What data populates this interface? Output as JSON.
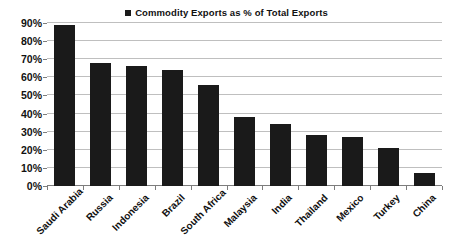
{
  "legend": {
    "swatch_color": "#1a1a1a",
    "label": "Commodity Exports as % of Total Exports"
  },
  "axis": {
    "y_ticks": [
      "0%",
      "10%",
      "20%",
      "30%",
      "40%",
      "50%",
      "60%",
      "70%",
      "80%",
      "90%"
    ]
  },
  "chart_data": {
    "type": "bar",
    "title": "",
    "subtitle": "",
    "legend_entries": [
      "Commodity Exports as % of Total Exports"
    ],
    "legend_position": "top-center",
    "categories": [
      "Saudi Arabia",
      "Russia",
      "Indonesia",
      "Brazil",
      "South Africa",
      "Malaysia",
      "India",
      "Thailand",
      "Mexico",
      "Turkey",
      "China"
    ],
    "values": [
      89,
      68,
      66,
      64,
      56,
      38,
      34,
      28,
      27,
      21,
      7
    ],
    "value_unit": "%",
    "xlabel": "",
    "ylabel": "",
    "ylim": [
      0,
      90
    ],
    "ytick_values": [
      0,
      10,
      20,
      30,
      40,
      50,
      60,
      70,
      80,
      90
    ],
    "ytick_labels": [
      "0%",
      "10%",
      "20%",
      "30%",
      "40%",
      "50%",
      "60%",
      "70%",
      "80%",
      "90%"
    ],
    "grid": true,
    "grid_axis": "y",
    "bar_color": "#1a1a1a",
    "background_color": "#ffffff",
    "xtick_label_rotation": -45
  }
}
